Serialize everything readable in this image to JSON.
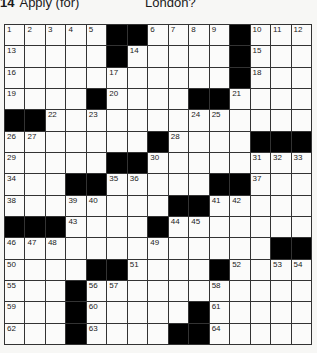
{
  "clues_visible": {
    "left": {
      "number": "14",
      "text": "Apply (for)"
    },
    "right": {
      "text": "London?"
    }
  },
  "grid": {
    "rows": 15,
    "cols": 15,
    "pattern": [
      ".....##....#...",
      ".....#.....#...",
      "...........#...",
      "....#....##....",
      "##.............",
      ".......#....###",
      ".....##........",
      "...##.....##...",
      "........##.....",
      "###....#.......",
      ".............##",
      "....##....#....",
      "...#...........",
      "...#.....#.....",
      "...#....##....."
    ],
    "numbers": [
      {
        "r": 0,
        "c": 0,
        "n": "1"
      },
      {
        "r": 0,
        "c": 1,
        "n": "2"
      },
      {
        "r": 0,
        "c": 2,
        "n": "3"
      },
      {
        "r": 0,
        "c": 3,
        "n": "4"
      },
      {
        "r": 0,
        "c": 4,
        "n": "5"
      },
      {
        "r": 0,
        "c": 7,
        "n": "6"
      },
      {
        "r": 0,
        "c": 8,
        "n": "7"
      },
      {
        "r": 0,
        "c": 9,
        "n": "8"
      },
      {
        "r": 0,
        "c": 10,
        "n": "9"
      },
      {
        "r": 0,
        "c": 12,
        "n": "10"
      },
      {
        "r": 0,
        "c": 13,
        "n": "11"
      },
      {
        "r": 0,
        "c": 14,
        "n": "12"
      },
      {
        "r": 1,
        "c": 0,
        "n": "13"
      },
      {
        "r": 1,
        "c": 6,
        "n": "14"
      },
      {
        "r": 1,
        "c": 12,
        "n": "15"
      },
      {
        "r": 2,
        "c": 0,
        "n": "16"
      },
      {
        "r": 2,
        "c": 5,
        "n": "17"
      },
      {
        "r": 2,
        "c": 12,
        "n": "18"
      },
      {
        "r": 3,
        "c": 0,
        "n": "19"
      },
      {
        "r": 3,
        "c": 5,
        "n": "20"
      },
      {
        "r": 3,
        "c": 11,
        "n": "21"
      },
      {
        "r": 4,
        "c": 2,
        "n": "22"
      },
      {
        "r": 4,
        "c": 4,
        "n": "23"
      },
      {
        "r": 4,
        "c": 9,
        "n": "24"
      },
      {
        "r": 4,
        "c": 10,
        "n": "25"
      },
      {
        "r": 5,
        "c": 0,
        "n": "26"
      },
      {
        "r": 5,
        "c": 1,
        "n": "27"
      },
      {
        "r": 5,
        "c": 8,
        "n": "28"
      },
      {
        "r": 6,
        "c": 0,
        "n": "29"
      },
      {
        "r": 6,
        "c": 7,
        "n": "30"
      },
      {
        "r": 6,
        "c": 12,
        "n": "31"
      },
      {
        "r": 6,
        "c": 13,
        "n": "32"
      },
      {
        "r": 6,
        "c": 14,
        "n": "33"
      },
      {
        "r": 7,
        "c": 0,
        "n": "34"
      },
      {
        "r": 7,
        "c": 5,
        "n": "35"
      },
      {
        "r": 7,
        "c": 6,
        "n": "36"
      },
      {
        "r": 7,
        "c": 12,
        "n": "37"
      },
      {
        "r": 8,
        "c": 0,
        "n": "38"
      },
      {
        "r": 8,
        "c": 3,
        "n": "39"
      },
      {
        "r": 8,
        "c": 4,
        "n": "40"
      },
      {
        "r": 8,
        "c": 10,
        "n": "41"
      },
      {
        "r": 8,
        "c": 11,
        "n": "42"
      },
      {
        "r": 9,
        "c": 3,
        "n": "43"
      },
      {
        "r": 9,
        "c": 8,
        "n": "44"
      },
      {
        "r": 9,
        "c": 9,
        "n": "45"
      },
      {
        "r": 10,
        "c": 0,
        "n": "46"
      },
      {
        "r": 10,
        "c": 1,
        "n": "47"
      },
      {
        "r": 10,
        "c": 2,
        "n": "48"
      },
      {
        "r": 10,
        "c": 7,
        "n": "49"
      },
      {
        "r": 11,
        "c": 0,
        "n": "50"
      },
      {
        "r": 11,
        "c": 6,
        "n": "51"
      },
      {
        "r": 11,
        "c": 11,
        "n": "52"
      },
      {
        "r": 11,
        "c": 13,
        "n": "53"
      },
      {
        "r": 11,
        "c": 14,
        "n": "54"
      },
      {
        "r": 12,
        "c": 0,
        "n": "55"
      },
      {
        "r": 12,
        "c": 4,
        "n": "56"
      },
      {
        "r": 12,
        "c": 5,
        "n": "57"
      },
      {
        "r": 12,
        "c": 10,
        "n": "58"
      },
      {
        "r": 13,
        "c": 0,
        "n": "59"
      },
      {
        "r": 13,
        "c": 4,
        "n": "60"
      },
      {
        "r": 13,
        "c": 10,
        "n": "61"
      },
      {
        "r": 14,
        "c": 0,
        "n": "62"
      },
      {
        "r": 14,
        "c": 4,
        "n": "63"
      },
      {
        "r": 14,
        "c": 10,
        "n": "64"
      }
    ]
  },
  "colors": {
    "black_square": "#000000",
    "white_square": "#fbfbfa",
    "grid_line": "#333333"
  }
}
